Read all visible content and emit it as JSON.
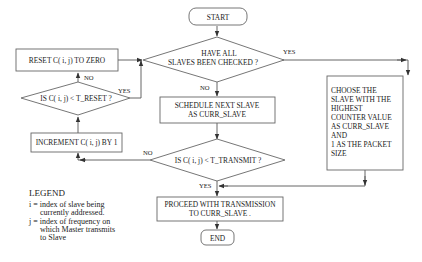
{
  "diagram": {
    "type": "flowchart",
    "nodes": {
      "start": {
        "label": "START",
        "shape": "terminator"
      },
      "all_checked": {
        "lines": [
          "HAVE ALL",
          "SLAVES BEEN CHECKED ?"
        ],
        "shape": "decision"
      },
      "schedule": {
        "lines": [
          "SCHEDULE NEXT SLAVE",
          "AS CURR_SLAVE"
        ],
        "shape": "process"
      },
      "transmit_check": {
        "label": "IS C( i, j) < T_TRANSMIT ?",
        "shape": "decision"
      },
      "proceed": {
        "lines": [
          "PROCEED WITH TRANSMISSION",
          "TO CURR_SLAVE ."
        ],
        "shape": "process"
      },
      "end": {
        "label": "END",
        "shape": "terminator"
      },
      "choose": {
        "lines": [
          "CHOOSE THE",
          "SLAVE WITH THE",
          "HIGHEST",
          "COUNTER VALUE",
          "AS CURR_SLAVE",
          "AND",
          "1 AS THE PACKET",
          "SIZE"
        ],
        "shape": "process"
      },
      "reset": {
        "label": "RESET C( i, j) TO ZERO",
        "shape": "process"
      },
      "reset_check": {
        "label": "IS C( i, j) < T_RESET ?",
        "shape": "decision"
      },
      "increment": {
        "label": "INCREMENT C( i, j) BY 1",
        "shape": "process"
      }
    },
    "edge_labels": {
      "all_checked_yes": "YES",
      "all_checked_no": "NO",
      "reset_check_yes": "YES",
      "reset_check_no": "NO",
      "transmit_check_no": "NO",
      "transmit_check_yes": "YES"
    },
    "edges": [
      {
        "from": "start",
        "to": "all_checked"
      },
      {
        "from": "all_checked",
        "to": "choose",
        "label": "YES"
      },
      {
        "from": "all_checked",
        "to": "schedule",
        "label": "NO"
      },
      {
        "from": "schedule",
        "to": "transmit_check"
      },
      {
        "from": "transmit_check",
        "to": "increment",
        "label": "NO"
      },
      {
        "from": "transmit_check",
        "to": "proceed",
        "label": "YES"
      },
      {
        "from": "choose",
        "to": "proceed"
      },
      {
        "from": "increment",
        "to": "reset_check"
      },
      {
        "from": "reset_check",
        "to": "reset",
        "label": "NO"
      },
      {
        "from": "reset_check",
        "to": "all_checked",
        "label": "YES"
      },
      {
        "from": "reset",
        "to": "all_checked"
      },
      {
        "from": "proceed",
        "to": "end"
      }
    ]
  },
  "legend": {
    "title": "LEGEND",
    "lines": [
      "i = index of slave being",
      "currently addressed.",
      "j = index of frequency on",
      "which Master transmits",
      "to Slave"
    ]
  }
}
